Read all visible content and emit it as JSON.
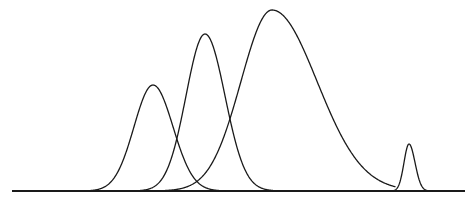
{
  "chart_data": {
    "type": "line",
    "title": "",
    "xlabel": "",
    "ylabel": "",
    "grid": false,
    "legend": null,
    "axes_visible": false,
    "baseline": {
      "x_start": 12,
      "x_end": 465,
      "y": 191
    },
    "series": [
      {
        "name": "peak-1",
        "apex_x": 153,
        "apex_y": 85,
        "sigma_left": 19,
        "sigma_right": 20,
        "extent": [
          90,
          225
        ]
      },
      {
        "name": "peak-2",
        "apex_x": 205,
        "apex_y": 34,
        "sigma_left": 19,
        "sigma_right": 20,
        "extent": [
          140,
          280
        ]
      },
      {
        "name": "peak-3",
        "apex_x": 272,
        "apex_y": 10,
        "sigma_left": 31,
        "sigma_right": 45,
        "extent": [
          145,
          395
        ]
      },
      {
        "name": "peak-4",
        "apex_x": 409,
        "apex_y": 144,
        "sigma_left": 5,
        "sigma_right": 6,
        "extent": [
          390,
          432
        ]
      }
    ],
    "colors": {
      "stroke": "#1a1a1a",
      "background": "#ffffff"
    }
  }
}
